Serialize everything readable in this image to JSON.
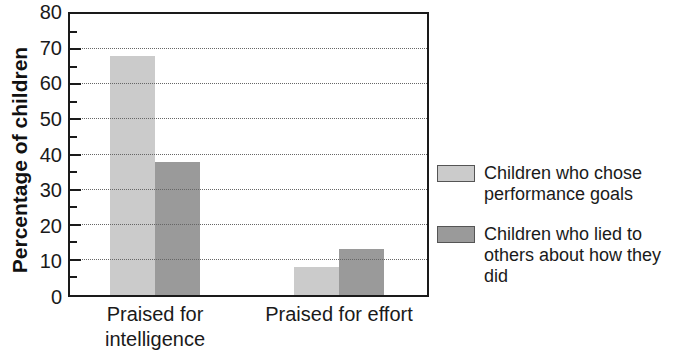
{
  "chart_data": {
    "type": "bar",
    "categories": [
      "Praised for intelligence",
      "Praised for effort"
    ],
    "series": [
      {
        "name": "Children who chose performance goals",
        "values": [
          68,
          8
        ],
        "color": "#cbcbcb"
      },
      {
        "name": "Children who lied to others about how they did",
        "values": [
          38,
          13
        ],
        "color": "#9a9a9a"
      }
    ],
    "title": "",
    "xlabel": "",
    "ylabel": "Percentage of children",
    "ylim": [
      0,
      80
    ],
    "yticks": [
      0,
      10,
      20,
      30,
      40,
      50,
      60,
      70,
      80
    ],
    "ytick_step": 10,
    "yminor_step": 5,
    "grid": "horizontal-dotted",
    "legend_position": "right-of-plot"
  },
  "style": {
    "bar_light": "#cbcbcb",
    "bar_dark": "#9a9a9a",
    "frame_color": "#1a1a1a",
    "gridline_color": "#666666",
    "text_color": "#1a1a1a",
    "background": "#ffffff"
  }
}
